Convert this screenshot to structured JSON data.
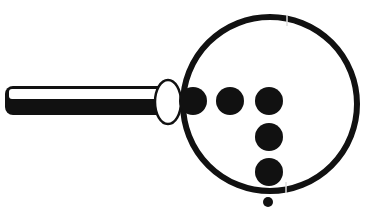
{
  "figure": {
    "colors": {
      "ink": "#111111",
      "background": "#ffffff"
    },
    "icon": "magnifying-glass-icon",
    "dots_count": 6
  }
}
